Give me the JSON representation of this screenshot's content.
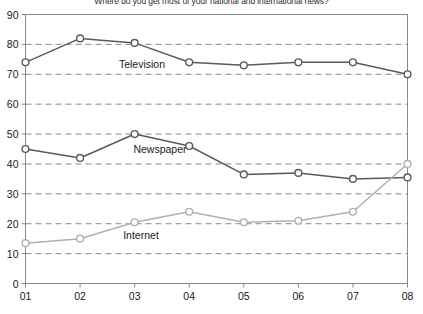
{
  "chart_data": {
    "type": "line",
    "title": "Where do you get most of your national and international news?",
    "xlabel": "",
    "ylabel": "",
    "categories": [
      "01",
      "02",
      "03",
      "04",
      "05",
      "06",
      "07",
      "08"
    ],
    "ylim": [
      0,
      90
    ],
    "yticks": [
      0,
      10,
      20,
      30,
      40,
      50,
      60,
      70,
      80,
      90
    ],
    "grid": true,
    "grid_style": "dashed-horizontal",
    "legend": "inline-labels",
    "marker": "open-circle",
    "series": [
      {
        "name": "Television",
        "color": "#5a5a5a",
        "label_x": "03",
        "values": [
          74,
          82,
          80.5,
          74,
          73,
          74,
          74,
          70
        ]
      },
      {
        "name": "Newspaper",
        "color": "#5a5a5a",
        "label_x": "04",
        "values": [
          45,
          42,
          50,
          46,
          36.5,
          37,
          35,
          35.5
        ]
      },
      {
        "name": "Internet",
        "color": "#b0b0b0",
        "label_x": "03",
        "values": [
          13.5,
          15,
          20.5,
          24,
          20.5,
          21,
          24,
          40
        ]
      }
    ]
  },
  "axis": {
    "y_tick_labels": [
      "0",
      "10",
      "20",
      "30",
      "40",
      "50",
      "60",
      "70",
      "80",
      "90"
    ],
    "x_tick_labels": [
      "01",
      "02",
      "03",
      "04",
      "05",
      "06",
      "07",
      "08"
    ]
  },
  "series_labels": {
    "television": "Television",
    "newspaper": "Newspaper",
    "internet": "Internet"
  },
  "colors": {
    "dark_line": "#5a5a5a",
    "light_line": "#b0b0b0",
    "frame": "#8a8a8a",
    "grid": "#8a8a8a",
    "text": "#1a1a1a",
    "background": "#ffffff"
  }
}
